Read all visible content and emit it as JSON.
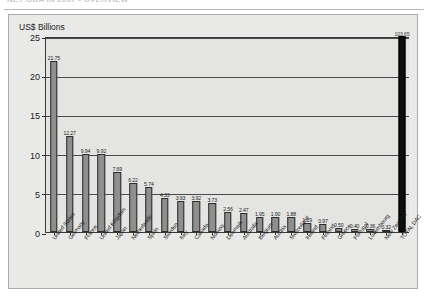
{
  "header": {
    "title": "NET ODA IN 2007 - OVERVIEW"
  },
  "panel": {
    "axis_title": "US$ Billions"
  },
  "colors": {
    "bar": "#8f8f8f",
    "bar_total": "#0d0d0d",
    "panel_bg": "#e9e9e7",
    "plot_bg": "#e4e4e2",
    "axis": "#3a3a3a"
  },
  "chart_data": {
    "type": "bar",
    "title": "",
    "xlabel": "",
    "ylabel": "US$ Billions",
    "ylim": [
      0,
      25
    ],
    "yticks": [
      0,
      5,
      10,
      15,
      20,
      25
    ],
    "ytick_labels": [
      "0",
      "5",
      "10",
      "15",
      "20",
      "25"
    ],
    "grid": true,
    "legend": "none",
    "categories": [
      "United States",
      "Germany",
      "France",
      "United Kingdom",
      "Japan",
      "Netherlands",
      "Spain",
      "Sweden",
      "Italy",
      "Canada",
      "Norway",
      "Denmark",
      "Australia",
      "Belgium",
      "Austria",
      "Switzerland",
      "Ireland",
      "Finland",
      "Greece",
      "Portugal",
      "Luxembourg",
      "New Zealand",
      "TOTAL DAC"
    ],
    "values": [
      21.75,
      12.27,
      9.94,
      9.92,
      7.69,
      6.22,
      5.74,
      4.33,
      3.93,
      3.92,
      3.73,
      2.56,
      2.47,
      1.95,
      1.9,
      1.88,
      1.19,
      0.97,
      0.5,
      0.4,
      0.36,
      0.32,
      103.65
    ],
    "value_labels": [
      "21.75",
      "12.27",
      "9.94",
      "9.92",
      "7.69",
      "6.22",
      "5.74",
      "4.33",
      "3.93",
      "3.92",
      "3.73",
      "2.56",
      "2.47",
      "1.95",
      "1.90",
      "1.88",
      "1.19",
      "0.97",
      "0.50",
      "0.40",
      "0.36",
      "0.32",
      "103.65"
    ],
    "total_index": 22
  }
}
